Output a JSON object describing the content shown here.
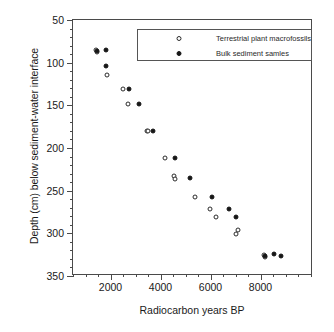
{
  "chart_data": {
    "type": "scatter",
    "title": "",
    "xlabel": "Radiocarbon years BP",
    "ylabel": "Depth (cm) below sediment-water interface",
    "xlim": [
      500,
      10100
    ],
    "ylim": [
      50,
      350
    ],
    "y_inverted": true,
    "grid": false,
    "x_ticks": [
      2000,
      4000,
      6000,
      8000
    ],
    "x_tick_labels": [
      "2000",
      "4000",
      "6000",
      "8000"
    ],
    "x_minor_step": 500,
    "y_ticks": [
      50,
      100,
      150,
      200,
      250,
      300,
      350
    ],
    "y_tick_labels": [
      "50",
      "100",
      "150",
      "200",
      "250",
      "300",
      "350"
    ],
    "y_minor_step": 10,
    "legend_position": "top-right-inside",
    "marker_colors": {
      "open": "#ffffff",
      "open_edge": "#2b2b2b",
      "filled": "#161616"
    },
    "series": [
      {
        "name": "Terrestrial plant macrofossils",
        "marker": "open-circle",
        "points": [
          {
            "x": 1420,
            "y": 85
          },
          {
            "x": 1460,
            "y": 88
          },
          {
            "x": 1870,
            "y": 114
          },
          {
            "x": 2510,
            "y": 131
          },
          {
            "x": 2680,
            "y": 149
          },
          {
            "x": 3440,
            "y": 180
          },
          {
            "x": 3500,
            "y": 180
          },
          {
            "x": 4180,
            "y": 212
          },
          {
            "x": 4530,
            "y": 233
          },
          {
            "x": 4560,
            "y": 236
          },
          {
            "x": 5380,
            "y": 257
          },
          {
            "x": 5970,
            "y": 272
          },
          {
            "x": 6200,
            "y": 281
          },
          {
            "x": 7090,
            "y": 296
          },
          {
            "x": 7030,
            "y": 301
          },
          {
            "x": 8150,
            "y": 325
          },
          {
            "x": 8180,
            "y": 328
          }
        ]
      },
      {
        "name": "Bulk sediment samles",
        "marker": "filled-circle",
        "points": [
          {
            "x": 1470,
            "y": 86
          },
          {
            "x": 1810,
            "y": 85
          },
          {
            "x": 1810,
            "y": 104
          },
          {
            "x": 2720,
            "y": 131
          },
          {
            "x": 3150,
            "y": 149
          },
          {
            "x": 3690,
            "y": 180
          },
          {
            "x": 4560,
            "y": 212
          },
          {
            "x": 5180,
            "y": 235
          },
          {
            "x": 6050,
            "y": 257
          },
          {
            "x": 6750,
            "y": 272
          },
          {
            "x": 7010,
            "y": 281
          },
          {
            "x": 8160,
            "y": 326
          },
          {
            "x": 8520,
            "y": 324
          },
          {
            "x": 8820,
            "y": 327
          }
        ]
      }
    ]
  },
  "legend": {
    "entries": [
      {
        "label": "Terrestrial plant macrofossils",
        "marker": "open-circle"
      },
      {
        "label": "Bulk sediment samles",
        "marker": "filled-circle"
      }
    ]
  }
}
